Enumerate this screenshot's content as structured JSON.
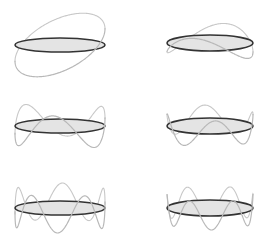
{
  "title": "",
  "colors": {
    "ring_fill": "#e4e4e4",
    "ring_stroke": "#333333",
    "wave_stroke": "#b8b8b8",
    "background": "#ffffff"
  },
  "panels": [
    {
      "id": "mode-1",
      "cx": 60,
      "cy": 45,
      "rx": 45,
      "ry": 7,
      "n": 1,
      "amp": 26,
      "phase": 0.9,
      "tilt": 0.0
    },
    {
      "id": "mode-2",
      "cx": 210,
      "cy": 43,
      "rx": 43,
      "ry": 8,
      "n": 2,
      "amp": 12,
      "phase": 2.4,
      "tilt": 0.0
    },
    {
      "id": "mode-3",
      "cx": 60,
      "cy": 126,
      "rx": 45,
      "ry": 7,
      "n": 3,
      "amp": 17,
      "phase": 1.1,
      "tilt": 0.0
    },
    {
      "id": "mode-4",
      "cx": 210,
      "cy": 126,
      "rx": 43,
      "ry": 8,
      "n": 4,
      "amp": 13,
      "phase": 0.5,
      "tilt": 0.0
    },
    {
      "id": "mode-5",
      "cx": 60,
      "cy": 208,
      "rx": 45,
      "ry": 7,
      "n": 5,
      "amp": 18,
      "phase": 1.3,
      "tilt": 0.0
    },
    {
      "id": "mode-6",
      "cx": 210,
      "cy": 208,
      "rx": 43,
      "ry": 8,
      "n": 6,
      "amp": 14,
      "phase": 0.2,
      "tilt": 0.0
    }
  ]
}
